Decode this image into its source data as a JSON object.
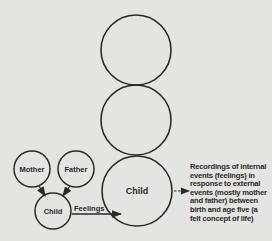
{
  "diagram": {
    "type": "parent-child recording diagram",
    "stack_circles": [
      {
        "id": "top",
        "label": ""
      },
      {
        "id": "middle",
        "label": ""
      },
      {
        "id": "bottom",
        "label": "Child"
      }
    ],
    "small_circles": {
      "mother": "Mother",
      "father": "Father",
      "child": "Child"
    },
    "arrow_label": "Feelings",
    "description_lines": [
      "Recordings of internal",
      "events (feelings) in",
      "response to external",
      "events (mostly mother",
      "and father) between",
      "birth and age five (a",
      "felt concept of life)"
    ],
    "colors": {
      "background": "#e4e4e2",
      "stroke": "#2a2a2a"
    }
  }
}
